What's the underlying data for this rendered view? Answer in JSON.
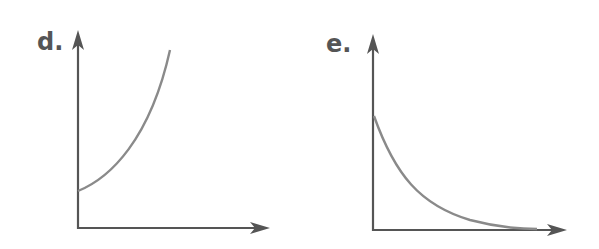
{
  "panels": [
    {
      "label": "d.",
      "curve": "exponential-growth",
      "description": "Increasing, concave-up curve starting at a positive y-intercept"
    },
    {
      "label": "e.",
      "curve": "exponential-decay",
      "description": "Decreasing, concave-up curve approaching the x-axis"
    }
  ],
  "colors": {
    "axis": "#555555",
    "curve": "#8a8a8a",
    "label": "#555555"
  }
}
